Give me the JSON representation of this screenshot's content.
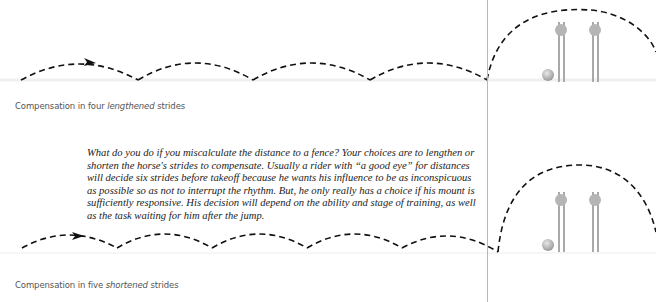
{
  "figure_top": {
    "caption_prefix": "Compensation in four ",
    "caption_emphasis": "lengthened",
    "caption_suffix": " strides"
  },
  "body": {
    "paragraph": "What do you do if you miscalculate the distance to a fence? Your choices are to lengthen or shorten the horse's strides to compensate. Usually a rider with “a good eye” for distances will decide six strides before takeoff because he wants his influence to be as inconspicuous as possible so as not to interrupt the rhythm. But, he only really has a choice if his mount is sufficiently responsive. His decision will depend on the ability and stage of training, as well as the task waiting for him after the jump."
  },
  "figure_bottom": {
    "caption_prefix": "Compensation in five ",
    "caption_emphasis": "shortened",
    "caption_suffix": " strides"
  },
  "colors": {
    "path_stroke": "#111111",
    "divider": "#b8b8b8",
    "fence_gray": "#a9a9a9",
    "caption_text": "#555555",
    "body_text": "#222222"
  }
}
